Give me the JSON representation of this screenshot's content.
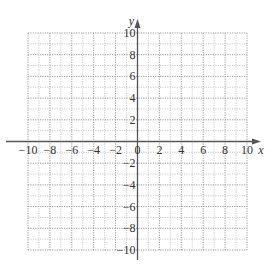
{
  "chart_data": {
    "type": "scatter",
    "title": "",
    "xlabel": "x",
    "ylabel": "y",
    "xlim": [
      -10,
      10
    ],
    "ylim": [
      -10,
      10
    ],
    "grid": true,
    "grid_step_minor": 1,
    "grid_step_major": 2,
    "x_ticks": [
      -10,
      -8,
      -6,
      -4,
      -2,
      0,
      2,
      4,
      6,
      8,
      10
    ],
    "x_tick_labels": [
      "−10",
      "−8",
      "−6",
      "−4",
      "−2",
      "0",
      "2",
      "4",
      "6",
      "8",
      "10"
    ],
    "y_ticks": [
      -10,
      -8,
      -6,
      -4,
      -2,
      2,
      4,
      6,
      8,
      10
    ],
    "y_tick_labels": [
      "−10",
      "−8",
      "−6",
      "−4",
      "−2",
      "2",
      "4",
      "6",
      "8",
      "10"
    ],
    "series": [],
    "colors": {
      "axis": "#555555",
      "grid_major": "#9a9a9a",
      "grid_minor": "#bdbdbd",
      "text": "#333333"
    }
  }
}
